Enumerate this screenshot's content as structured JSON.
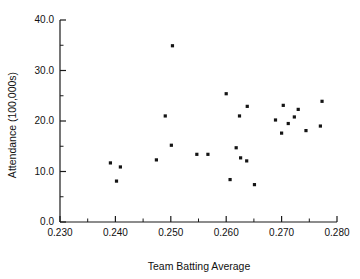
{
  "chart_data": {
    "type": "scatter",
    "title": "",
    "xlabel": "Team Batting Average",
    "ylabel": "Attendance (100,000s)",
    "xlim": [
      0.23,
      0.28
    ],
    "ylim": [
      0.0,
      40.0
    ],
    "grid": false,
    "legend": null,
    "x_ticks": [
      0.23,
      0.24,
      0.25,
      0.26,
      0.27,
      0.28
    ],
    "x_tick_labels": [
      "0.230",
      "0.240",
      "0.250",
      "0.260",
      "0.270",
      "0.280"
    ],
    "x_minor_ticks": [
      0.235,
      0.245,
      0.255,
      0.265,
      0.275
    ],
    "y_ticks": [
      0.0,
      10.0,
      20.0,
      30.0,
      40.0
    ],
    "y_tick_labels": [
      "0.0",
      "10.0",
      "20.0",
      "30.0",
      "40.0"
    ],
    "y_minor_ticks": [
      5.0,
      15.0,
      25.0,
      35.0
    ],
    "marker": "square",
    "marker_color": "#141414",
    "marker_size_px": 3.2,
    "points": [
      {
        "x": 0.2391,
        "y": 11.7
      },
      {
        "x": 0.2409,
        "y": 10.9
      },
      {
        "x": 0.2402,
        "y": 8.1
      },
      {
        "x": 0.2474,
        "y": 12.3
      },
      {
        "x": 0.249,
        "y": 21.0
      },
      {
        "x": 0.2501,
        "y": 15.2
      },
      {
        "x": 0.2503,
        "y": 34.9
      },
      {
        "x": 0.2547,
        "y": 13.4
      },
      {
        "x": 0.2567,
        "y": 13.4
      },
      {
        "x": 0.26,
        "y": 25.4
      },
      {
        "x": 0.2607,
        "y": 8.4
      },
      {
        "x": 0.2618,
        "y": 14.7
      },
      {
        "x": 0.2624,
        "y": 21.0
      },
      {
        "x": 0.2626,
        "y": 12.7
      },
      {
        "x": 0.2638,
        "y": 22.9
      },
      {
        "x": 0.2637,
        "y": 12.1
      },
      {
        "x": 0.2651,
        "y": 7.4
      },
      {
        "x": 0.2689,
        "y": 20.2
      },
      {
        "x": 0.27,
        "y": 17.6
      },
      {
        "x": 0.2703,
        "y": 23.1
      },
      {
        "x": 0.2712,
        "y": 19.5
      },
      {
        "x": 0.2723,
        "y": 20.8
      },
      {
        "x": 0.273,
        "y": 22.3
      },
      {
        "x": 0.2744,
        "y": 18.1
      },
      {
        "x": 0.277,
        "y": 19.0
      },
      {
        "x": 0.2773,
        "y": 23.9
      }
    ]
  }
}
